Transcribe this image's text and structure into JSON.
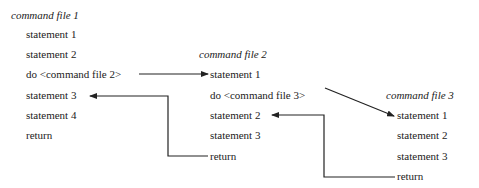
{
  "files": [
    {
      "title": "command file 1",
      "lines": [
        "statement 1",
        "statement 2",
        "do <command file 2>",
        "statement 3",
        "statement 4",
        "return"
      ]
    },
    {
      "title": "command file 2",
      "lines": [
        "statement 1",
        "do <command file 3>",
        "statement 2",
        "statement 3",
        "return"
      ]
    },
    {
      "title": "command file 3",
      "lines": [
        "statement 1",
        "statement 2",
        "statement 3",
        "return"
      ]
    }
  ],
  "colors": {
    "line": "#222222",
    "text": "#222222"
  }
}
